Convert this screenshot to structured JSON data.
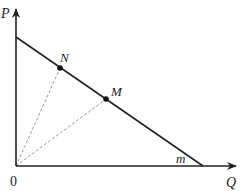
{
  "diagram": {
    "type": "economics-budget-line",
    "axes": {
      "y_label": "P",
      "x_label": "Q",
      "origin_label": "0"
    },
    "line": {
      "label": "m",
      "from": [
        16,
        37
      ],
      "to": [
        203,
        166
      ]
    },
    "points": [
      {
        "label": "N",
        "x": 60,
        "y": 68
      },
      {
        "label": "M",
        "x": 106,
        "y": 99
      }
    ],
    "rays_from_origin": [
      "N",
      "M"
    ],
    "colors": {
      "axis": "#222222",
      "line": "#222222",
      "dashed": "#9a9a9a",
      "point": "#111111"
    }
  }
}
